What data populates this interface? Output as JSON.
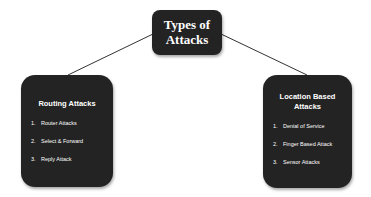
{
  "root": {
    "title_line1": "Types of",
    "title_line2": "Attacks"
  },
  "children": [
    {
      "title": "Routing Attacks",
      "items": [
        {
          "num": "1.",
          "label": "Router Attacks"
        },
        {
          "num": "2.",
          "label": "Select & Forward"
        },
        {
          "num": "3.",
          "label": "Reply Attack"
        }
      ]
    },
    {
      "title_line1": "Location Based",
      "title_line2": "Attacks",
      "items": [
        {
          "num": "1.",
          "label": "Denial of Service"
        },
        {
          "num": "2.",
          "label": "Finger Based Attack"
        },
        {
          "num": "3.",
          "label": "Sensor Attacks"
        }
      ]
    }
  ],
  "colors": {
    "box_fill": "#232323",
    "text": "#ffffff",
    "connector": "#333333"
  }
}
